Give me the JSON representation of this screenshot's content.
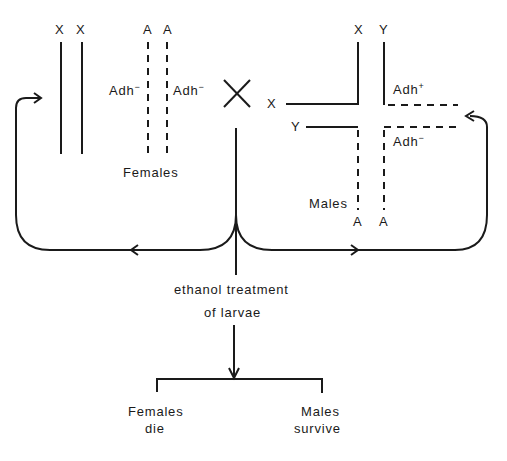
{
  "diagram": {
    "females": {
      "chromosome_labels": [
        "X",
        "X",
        "A",
        "A"
      ],
      "allele_left": "Adh",
      "allele_left_sup": "−",
      "allele_right": "Adh",
      "allele_right_sup": "−",
      "label": "Females"
    },
    "cross_symbol": "×",
    "males": {
      "top_labels": [
        "X",
        "Y"
      ],
      "left_labels": [
        "X",
        "Y"
      ],
      "bottom_labels": [
        "A",
        "A"
      ],
      "allele_plus": "Adh",
      "allele_plus_sup": "+",
      "allele_minus": "Adh",
      "allele_minus_sup": "−",
      "label": "Males"
    },
    "treatment": {
      "line1": "ethanol treatment",
      "line2": "of larvae"
    },
    "outcomes": {
      "females_line1": "Females",
      "females_line2": "die",
      "males_line1": "Males",
      "males_line2": "survive"
    }
  }
}
